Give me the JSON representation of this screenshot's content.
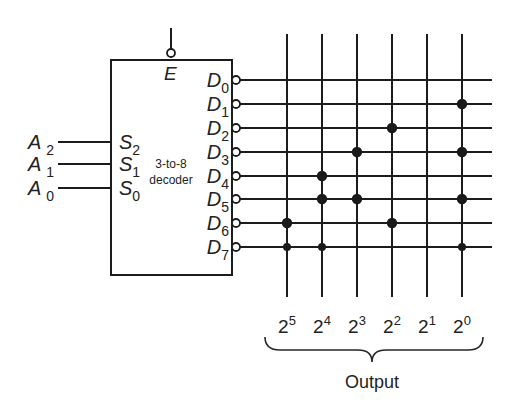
{
  "decoder": {
    "title_line1": "3-to-8",
    "title_line2": "decoder",
    "enable": {
      "label": "E",
      "active_low": true
    },
    "select_inputs": [
      {
        "pin": "S",
        "sub": "2",
        "input": "A",
        "input_sub": "2"
      },
      {
        "pin": "S",
        "sub": "1",
        "input": "A",
        "input_sub": "1"
      },
      {
        "pin": "S",
        "sub": "0",
        "input": "A",
        "input_sub": "0"
      }
    ],
    "outputs": [
      {
        "pin": "D",
        "sub": "0"
      },
      {
        "pin": "D",
        "sub": "1"
      },
      {
        "pin": "D",
        "sub": "2"
      },
      {
        "pin": "D",
        "sub": "3"
      },
      {
        "pin": "D",
        "sub": "4"
      },
      {
        "pin": "D",
        "sub": "5"
      },
      {
        "pin": "D",
        "sub": "6"
      },
      {
        "pin": "D",
        "sub": "7"
      }
    ],
    "outputs_active_low": true
  },
  "matrix": {
    "columns": [
      {
        "base": "2",
        "exp": "5"
      },
      {
        "base": "2",
        "exp": "4"
      },
      {
        "base": "2",
        "exp": "3"
      },
      {
        "base": "2",
        "exp": "2"
      },
      {
        "base": "2",
        "exp": "1"
      },
      {
        "base": "2",
        "exp": "0"
      }
    ],
    "connections": [
      [
        0,
        0,
        0,
        0,
        0,
        0
      ],
      [
        0,
        0,
        0,
        0,
        0,
        1
      ],
      [
        0,
        0,
        0,
        1,
        0,
        0
      ],
      [
        0,
        0,
        1,
        0,
        0,
        1
      ],
      [
        0,
        1,
        0,
        0,
        0,
        0
      ],
      [
        0,
        1,
        1,
        0,
        0,
        1
      ],
      [
        1,
        0,
        0,
        1,
        0,
        0
      ],
      [
        1,
        1,
        0,
        0,
        0,
        1
      ]
    ]
  },
  "output_label": "Output",
  "colors": {
    "ink": "#1c1c1c",
    "background": "#ffffff"
  }
}
